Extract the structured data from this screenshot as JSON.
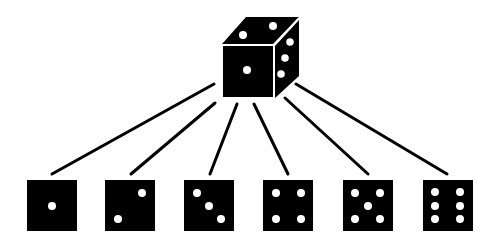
{
  "diagram": {
    "colors": {
      "background": "#ffffff",
      "die_fill": "#000000",
      "pip": "#ffffff",
      "connector": "#000000",
      "edge_highlight": "#ffffff"
    },
    "source_die": {
      "label": "die",
      "front_face_value": 1,
      "top_face_value": 2,
      "right_face_value": 3
    },
    "outcomes": [
      {
        "value": 1,
        "label": "one"
      },
      {
        "value": 2,
        "label": "two"
      },
      {
        "value": 3,
        "label": "three"
      },
      {
        "value": 4,
        "label": "four"
      },
      {
        "value": 5,
        "label": "five"
      },
      {
        "value": 6,
        "label": "six"
      }
    ],
    "connector_count": 6
  }
}
